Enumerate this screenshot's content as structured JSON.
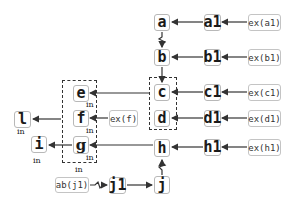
{
  "diagram": {
    "nodes": {
      "a": "a",
      "a1": "a1",
      "b": "b",
      "b1": "b1",
      "c": "c",
      "c1": "c1",
      "d": "d",
      "d1": "d1",
      "e": "e",
      "f": "f",
      "g": "g",
      "h": "h",
      "h1": "h1",
      "i": "i",
      "j": "j",
      "j1": "j1",
      "l": "l"
    },
    "externals": {
      "ex_a1": "ex(a1)",
      "ex_b1": "ex(b1)",
      "ex_c1": "ex(c1)",
      "ex_d1": "ex(d1)",
      "ex_h1": "ex(h1)",
      "ex_f": "ex(f)",
      "ab_j1": "ab(j1)"
    },
    "labels": {
      "in_e": "in",
      "in_f": "in",
      "in_g": "in",
      "in_group": "in",
      "in_l": "in",
      "in_i": "in"
    },
    "groups": [
      "c-d group",
      "e-f-g group"
    ],
    "edges": [
      {
        "from": "ex(a1)",
        "to": "a1"
      },
      {
        "from": "a1",
        "to": "a"
      },
      {
        "from": "ex(b1)",
        "to": "b1"
      },
      {
        "from": "b1",
        "to": "b"
      },
      {
        "from": "a",
        "to": "b",
        "style": "broken"
      },
      {
        "from": "b",
        "to": "c-d group"
      },
      {
        "from": "ex(c1)",
        "to": "c1"
      },
      {
        "from": "c1",
        "to": "c"
      },
      {
        "from": "ex(d1)",
        "to": "d1"
      },
      {
        "from": "d1",
        "to": "d"
      },
      {
        "from": "ex(h1)",
        "to": "h1"
      },
      {
        "from": "h1",
        "to": "h"
      },
      {
        "from": "c",
        "to": "e"
      },
      {
        "from": "ex(f)",
        "to": "f"
      },
      {
        "from": "h",
        "to": "g"
      },
      {
        "from": "e-f-g group",
        "to": "l"
      },
      {
        "from": "g",
        "to": "i"
      },
      {
        "from": "j",
        "to": "h",
        "style": "broken"
      },
      {
        "from": "ab(j1)",
        "to": "j1",
        "style": "broken"
      },
      {
        "from": "j1",
        "to": "j"
      }
    ],
    "colors": {
      "stroke": "#333333",
      "box_border": "#b8b8b8"
    }
  }
}
